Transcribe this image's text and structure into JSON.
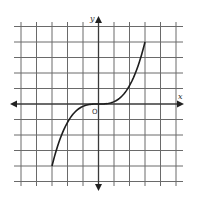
{
  "chart_data": {
    "type": "line",
    "title": "",
    "xlabel": "x",
    "ylabel": "y",
    "origin_label": "O",
    "grid": true,
    "xlim": [
      -5,
      5
    ],
    "ylim": [
      -5,
      5
    ],
    "grid_step": 1,
    "tick_labels": [],
    "series": [
      {
        "name": "curve",
        "description": "cubic-shaped curve through origin, increasing, inflection at origin",
        "x": [
          -3,
          -2,
          -1,
          0,
          1,
          2,
          3
        ],
        "y": [
          -4,
          -1.19,
          -0.15,
          0,
          0.15,
          1.19,
          4
        ],
        "endpoints": [
          [
            -3,
            -4
          ],
          [
            3,
            4
          ]
        ]
      }
    ]
  },
  "axes": {
    "x_label": "x",
    "y_label": "y",
    "origin_label": "O"
  }
}
